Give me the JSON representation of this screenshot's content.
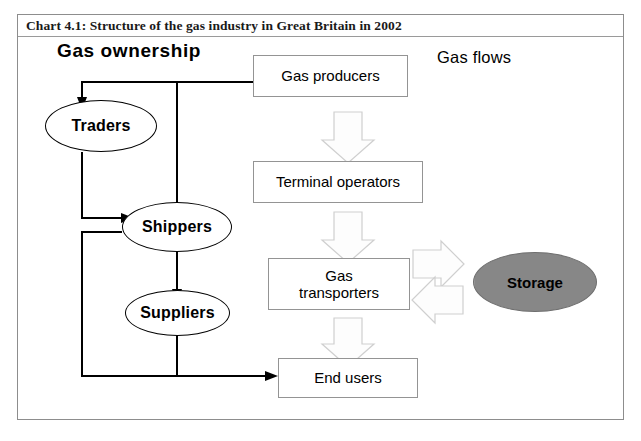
{
  "chart": {
    "title": "Chart 4.1: Structure of the gas industry in Great Britain in 2002",
    "headings": {
      "left": "Gas ownership",
      "right": "Gas flows"
    }
  },
  "nodes": {
    "gas_producers": "Gas producers",
    "terminal_operators": "Terminal operators",
    "gas_transporters_line1": "Gas",
    "gas_transporters_line2": "transporters",
    "end_users": "End users",
    "traders": "Traders",
    "shippers": "Shippers",
    "suppliers": "Suppliers",
    "storage": "Storage"
  },
  "colors": {
    "frame_border": "#8d8d8d",
    "box_border": "#949494",
    "shape_border": "#000000",
    "storage_fill": "#8c8c8c",
    "block_arrow_fill": "#fdfdfd",
    "block_arrow_stroke": "#cfcfcf",
    "connector": "#000000",
    "text": "#000000"
  },
  "icons": {
    "flow_arrow_down": "block-arrow-down-icon",
    "flow_arrow_right": "block-arrow-right-icon",
    "flow_arrow_left": "block-arrow-left-icon"
  }
}
